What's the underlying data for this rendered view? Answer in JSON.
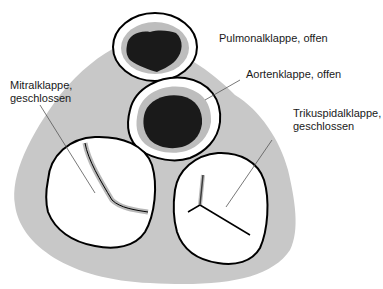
{
  "labels": {
    "pulmonal": "Pulmonalklappe, offen",
    "aorten": "Aortenklappe, offen",
    "mitral_line1": "Mitralklappe,",
    "mitral_line2": "geschlossen",
    "trikuspidal_line1": "Trikuspidalklappe,",
    "trikuspidal_line2": "geschlossen"
  },
  "colors": {
    "background_shape": "#c8c8c8",
    "valve_ring": "#ffffff",
    "valve_outline": "#000000",
    "open_orifice": "#1a1a1a",
    "leader_line": "#555555"
  }
}
